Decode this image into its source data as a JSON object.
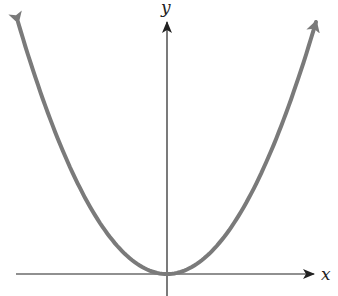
{
  "chart_data": {
    "type": "line",
    "title": "",
    "xlabel": "x",
    "ylabel": "y",
    "function": "y = x^2",
    "x": [
      -3,
      -2.5,
      -2,
      -1.5,
      -1,
      -0.5,
      0,
      0.5,
      1,
      1.5,
      2,
      2.5,
      3
    ],
    "series": [
      {
        "name": "y = x^2",
        "values": [
          9,
          6.25,
          4,
          2.25,
          1,
          0.25,
          0,
          0.25,
          1,
          2.25,
          4,
          6.25,
          9
        ]
      }
    ],
    "xlim": [
      -3.3,
      3.3
    ],
    "ylim": [
      -0.5,
      9.5
    ],
    "grid": false,
    "legend": "none",
    "colors": {
      "curve": "#7a7a7a",
      "axes": "#222222"
    }
  },
  "labels": {
    "x_axis": "x",
    "y_axis": "y"
  }
}
